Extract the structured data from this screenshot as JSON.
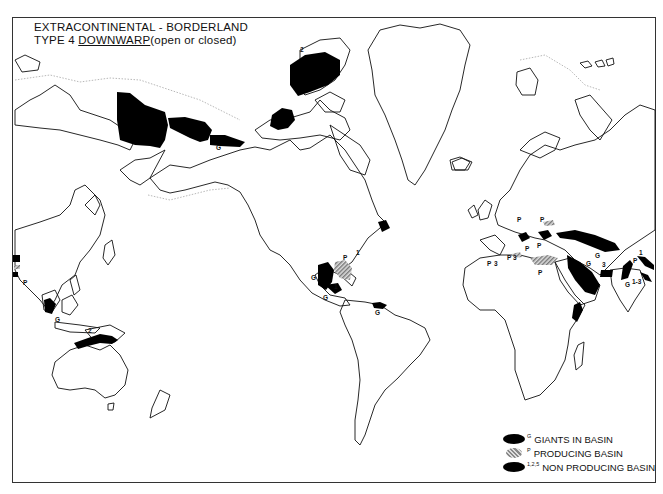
{
  "title": {
    "line1": "EXTRACONTINENTAL - BORDERLAND",
    "line2_prefix": "TYPE 4",
    "line2_underlined": "DOWNWARP",
    "line2_suffix": "(open or closed)"
  },
  "legend": {
    "items": [
      {
        "symbol": "black-basin",
        "superscript": "G",
        "label": "GIANTS IN BASIN"
      },
      {
        "symbol": "hatched-basin",
        "superscript": "P",
        "label": "PRODUCING BASIN"
      },
      {
        "symbol": "black-basin",
        "superscript": "1,2,5",
        "label": "NON PRODUCING BASIN"
      }
    ]
  },
  "map_labels": {
    "alaska_g": "G",
    "arctic_2": "2",
    "gulf_p": "P",
    "gulf_g": "G",
    "gulf_1": "1",
    "mexico_g": "G",
    "venezuela_g": "G",
    "east_us_1": "1",
    "europe_p1": "P",
    "europe_p2": "P",
    "med_p1": "P",
    "med_3a": "3",
    "med_p2": "P",
    "med_3b": "3",
    "med_p3": "P",
    "med_p4": "P",
    "levant_p": "P",
    "caspian_g": "G",
    "persian_g": "G",
    "pakistan_3": "3",
    "india_p": "P",
    "india_g": "G",
    "india_13": "1-3",
    "himalaya_1": "1",
    "asia_p": "P",
    "asia_g": "G",
    "asia_2": "2"
  },
  "colors": {
    "basin": "#000000",
    "producing_hatch": "#888888",
    "coastline": "#111111",
    "shelf_edge": "#999999"
  }
}
